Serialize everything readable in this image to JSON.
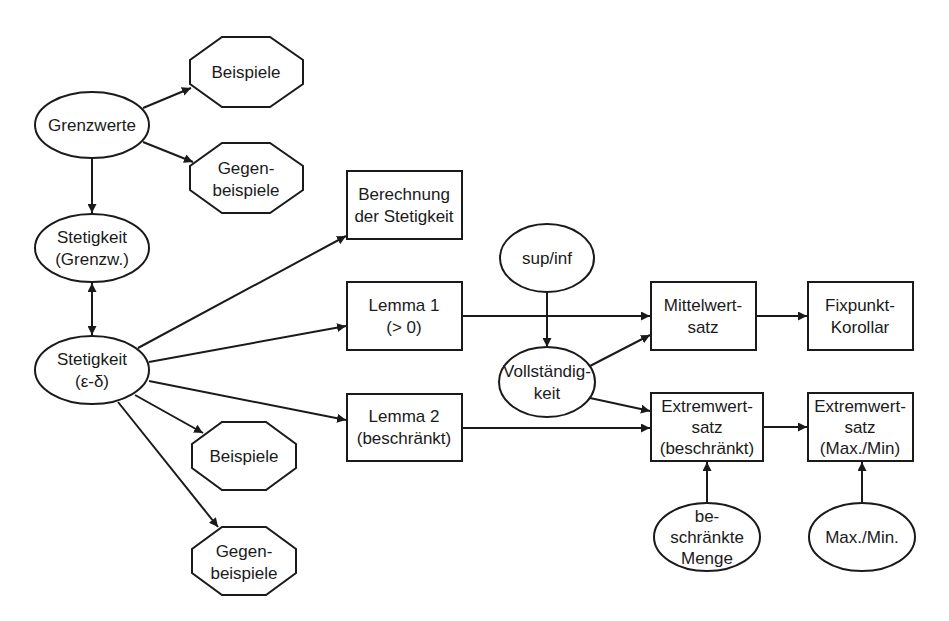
{
  "diagram": {
    "colors": {
      "stroke": "#1a1a1a",
      "fill": "#ffffff",
      "background": "#ffffff"
    },
    "nodes": {
      "grenzwerte": {
        "shape": "ellipse",
        "lines": [
          "Grenzwerte"
        ]
      },
      "beispiele_top": {
        "shape": "octagon",
        "lines": [
          "Beispiele"
        ]
      },
      "gegenbeispiele_top": {
        "shape": "octagon",
        "lines": [
          "Gegen-",
          "beispiele"
        ]
      },
      "stetigkeit_grenzw": {
        "shape": "ellipse",
        "lines": [
          "Stetigkeit",
          "(Grenzw.)"
        ]
      },
      "stetigkeit_eps": {
        "shape": "ellipse",
        "lines": [
          "Stetigkeit",
          "(ε-δ)"
        ]
      },
      "beispiele_bottom": {
        "shape": "octagon",
        "lines": [
          "Beispiele"
        ]
      },
      "gegenbeispiele_bottom": {
        "shape": "octagon",
        "lines": [
          "Gegen-",
          "beispiele"
        ]
      },
      "berechnung": {
        "shape": "box",
        "lines": [
          "Berechnung",
          "der Stetigkeit"
        ]
      },
      "supinf": {
        "shape": "ellipse",
        "lines": [
          "sup/inf"
        ]
      },
      "lemma1": {
        "shape": "box",
        "lines": [
          "Lemma 1",
          "(> 0)"
        ]
      },
      "vollstaendigkeit": {
        "shape": "ellipse",
        "lines": [
          "Vollständig-",
          "keit"
        ]
      },
      "lemma2": {
        "shape": "box",
        "lines": [
          "Lemma 2",
          "(beschränkt)"
        ]
      },
      "mittelwertsatz": {
        "shape": "box",
        "lines": [
          "Mittelwert-",
          "satz"
        ]
      },
      "fixpunkt": {
        "shape": "box",
        "lines": [
          "Fixpunkt-",
          "Korollar"
        ]
      },
      "extremwert_beschr": {
        "shape": "box",
        "lines": [
          "Extremwert-",
          "satz",
          "(beschränkt)"
        ]
      },
      "extremwert_maxmin": {
        "shape": "box",
        "lines": [
          "Extremwert-",
          "satz",
          "(Max./Min)"
        ]
      },
      "beschraenkte_menge": {
        "shape": "ellipse",
        "lines": [
          "be-",
          "schränkte",
          "Menge"
        ]
      },
      "maxmin": {
        "shape": "ellipse",
        "lines": [
          "Max./Min."
        ]
      }
    },
    "edges": [
      {
        "from": "grenzwerte",
        "to": "beispiele_top"
      },
      {
        "from": "grenzwerte",
        "to": "gegenbeispiele_top"
      },
      {
        "from": "grenzwerte",
        "to": "stetigkeit_grenzw"
      },
      {
        "from": "stetigkeit_grenzw",
        "to": "stetigkeit_eps",
        "bidirectional": true
      },
      {
        "from": "stetigkeit_eps",
        "to": "berechnung"
      },
      {
        "from": "stetigkeit_eps",
        "to": "lemma1"
      },
      {
        "from": "stetigkeit_eps",
        "to": "lemma2"
      },
      {
        "from": "stetigkeit_eps",
        "to": "beispiele_bottom"
      },
      {
        "from": "stetigkeit_eps",
        "to": "gegenbeispiele_bottom"
      },
      {
        "from": "supinf",
        "to": "vollstaendigkeit"
      },
      {
        "from": "lemma1",
        "to": "mittelwertsatz"
      },
      {
        "from": "vollstaendigkeit",
        "to": "mittelwertsatz"
      },
      {
        "from": "vollstaendigkeit",
        "to": "extremwert_beschr"
      },
      {
        "from": "lemma2",
        "to": "extremwert_beschr"
      },
      {
        "from": "mittelwertsatz",
        "to": "fixpunkt"
      },
      {
        "from": "extremwert_beschr",
        "to": "extremwert_maxmin"
      },
      {
        "from": "beschraenkte_menge",
        "to": "extremwert_beschr"
      },
      {
        "from": "maxmin",
        "to": "extremwert_maxmin"
      }
    ]
  }
}
